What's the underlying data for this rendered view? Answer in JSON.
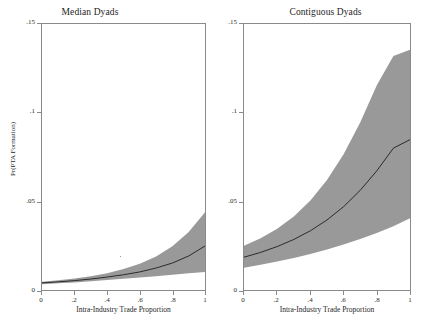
{
  "figure": {
    "yaxis_label": "Pr(PTA Formation)",
    "xaxis_label": "Intra-Industry Trade Proportion",
    "panel_left_title": "Median Dyads",
    "panel_right_title": "Contiguous Dyads",
    "band_color": "#999999",
    "line_color": "#2b2b2b",
    "axis_color": "#8a8a8a"
  },
  "ticks": {
    "y": [
      "0",
      ".05",
      ".1",
      ".15"
    ],
    "x": [
      "0",
      ".2",
      ".4",
      ".6",
      ".8",
      "1"
    ]
  },
  "chart_data": [
    {
      "type": "area",
      "title": "Median Dyads",
      "xlabel": "Intra-Industry Trade Proportion",
      "ylabel": "Pr(PTA Formation)",
      "xlim": [
        0,
        1
      ],
      "ylim": [
        0,
        0.15
      ],
      "grid": false,
      "legend": "none",
      "x": [
        0,
        0.1,
        0.2,
        0.3,
        0.4,
        0.5,
        0.6,
        0.7,
        0.8,
        0.9,
        1.0
      ],
      "series": [
        {
          "name": "Predicted Pr(PTA Formation)",
          "values": [
            0.004,
            0.0046,
            0.0053,
            0.0062,
            0.0073,
            0.0086,
            0.0102,
            0.0124,
            0.0152,
            0.0192,
            0.0248
          ]
        },
        {
          "name": "95% CI upper",
          "values": [
            0.0047,
            0.0055,
            0.0065,
            0.0078,
            0.0095,
            0.0118,
            0.0148,
            0.0189,
            0.0247,
            0.0327,
            0.0438
          ]
        },
        {
          "name": "95% CI lower",
          "values": [
            0.0033,
            0.0038,
            0.0043,
            0.0049,
            0.0056,
            0.0063,
            0.007,
            0.0078,
            0.0086,
            0.0094,
            0.0102
          ]
        }
      ]
    },
    {
      "type": "area",
      "title": "Contiguous Dyads",
      "xlabel": "Intra-Industry Trade Proportion",
      "ylabel": "Pr(PTA Formation)",
      "xlim": [
        0,
        1
      ],
      "ylim": [
        0,
        0.15
      ],
      "grid": false,
      "legend": "none",
      "x": [
        0,
        0.1,
        0.2,
        0.3,
        0.4,
        0.5,
        0.6,
        0.7,
        0.8,
        0.9,
        1.0
      ],
      "series": [
        {
          "name": "Predicted Pr(PTA Formation)",
          "values": [
            0.0185,
            0.0212,
            0.0245,
            0.0285,
            0.0334,
            0.0395,
            0.047,
            0.0562,
            0.0672,
            0.08,
            0.0848
          ]
        },
        {
          "name": "95% CI upper",
          "values": [
            0.025,
            0.0292,
            0.0345,
            0.0415,
            0.0505,
            0.062,
            0.0765,
            0.0945,
            0.1155,
            0.132,
            0.1355
          ]
        },
        {
          "name": "95% CI lower",
          "values": [
            0.0125,
            0.0142,
            0.016,
            0.018,
            0.0203,
            0.0228,
            0.0256,
            0.0287,
            0.0322,
            0.036,
            0.0405
          ]
        }
      ]
    }
  ]
}
